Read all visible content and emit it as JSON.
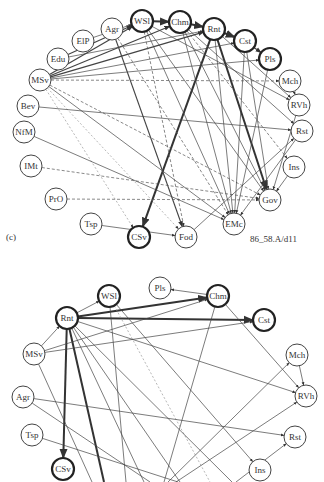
{
  "panel_c": {
    "label": "(c)",
    "caption": "86_58.A/d11",
    "nodes": [
      {
        "id": "WSl",
        "x": 142,
        "y": 21,
        "bold": true
      },
      {
        "id": "Chm",
        "x": 180,
        "y": 22,
        "bold": true
      },
      {
        "id": "Rnt",
        "x": 214,
        "y": 29,
        "bold": true
      },
      {
        "id": "Cst",
        "x": 245,
        "y": 41,
        "bold": true
      },
      {
        "id": "Pls",
        "x": 270,
        "y": 59,
        "bold": true
      },
      {
        "id": "Agr",
        "x": 112,
        "y": 29,
        "bold": false
      },
      {
        "id": "ElP",
        "x": 83,
        "y": 41,
        "bold": false
      },
      {
        "id": "Edu",
        "x": 58,
        "y": 59,
        "bold": false
      },
      {
        "id": "MSv",
        "x": 40,
        "y": 80,
        "bold": false
      },
      {
        "id": "Bev",
        "x": 28,
        "y": 106,
        "bold": false
      },
      {
        "id": "NfM",
        "x": 24,
        "y": 132,
        "bold": false
      },
      {
        "id": "IMt",
        "x": 31,
        "y": 166,
        "bold": false
      },
      {
        "id": "PrO",
        "x": 56,
        "y": 199,
        "bold": false
      },
      {
        "id": "Tsp",
        "x": 91,
        "y": 224,
        "bold": false
      },
      {
        "id": "CSv",
        "x": 139,
        "y": 237,
        "bold": true
      },
      {
        "id": "Fod",
        "x": 186,
        "y": 237,
        "bold": false
      },
      {
        "id": "EMc",
        "x": 234,
        "y": 224,
        "bold": false
      },
      {
        "id": "Gov",
        "x": 270,
        "y": 200,
        "bold": false
      },
      {
        "id": "Ins",
        "x": 294,
        "y": 167,
        "bold": false
      },
      {
        "id": "Rst",
        "x": 302,
        "y": 131,
        "bold": false
      },
      {
        "id": "RVh",
        "x": 299,
        "y": 105,
        "bold": false
      },
      {
        "id": "Mch",
        "x": 290,
        "y": 81,
        "bold": false
      }
    ],
    "edges": [
      {
        "from": "Rnt",
        "to": "CSv",
        "style": "thick"
      },
      {
        "from": "Rnt",
        "to": "Gov",
        "style": "thick"
      },
      {
        "from": "Agr",
        "to": "Fod",
        "style": "medium"
      },
      {
        "from": "WSl",
        "to": "Chm",
        "style": "thick"
      },
      {
        "from": "Chm",
        "to": "Rnt",
        "style": "thick"
      },
      {
        "from": "Rnt",
        "to": "Cst",
        "style": "thick"
      },
      {
        "from": "Cst",
        "to": "Pls",
        "style": "medium"
      },
      {
        "from": "MSv",
        "to": "WSl",
        "style": "medium"
      },
      {
        "from": "MSv",
        "to": "Chm",
        "style": "medium"
      },
      {
        "from": "MSv",
        "to": "Rnt",
        "style": "medium"
      },
      {
        "from": "MSv",
        "to": "Cst",
        "style": "normal"
      },
      {
        "from": "MSv",
        "to": "Pls",
        "style": "normal"
      },
      {
        "from": "MSv",
        "to": "Mch",
        "style": "dashed"
      },
      {
        "from": "MSv",
        "to": "EMc",
        "style": "normal"
      },
      {
        "from": "MSv",
        "to": "Gov",
        "style": "dashed"
      },
      {
        "from": "MSv",
        "to": "Fod",
        "style": "dotted"
      },
      {
        "from": "MSv",
        "to": "CSv",
        "style": "dotted"
      },
      {
        "from": "Edu",
        "to": "WSl",
        "style": "medium"
      },
      {
        "from": "Edu",
        "to": "Rnt",
        "style": "normal"
      },
      {
        "from": "ElP",
        "to": "WSl",
        "style": "normal"
      },
      {
        "from": "Bev",
        "to": "Rst",
        "style": "normal"
      },
      {
        "from": "NfM",
        "to": "EMc",
        "style": "normal"
      },
      {
        "from": "IMt",
        "to": "Gov",
        "style": "dashed"
      },
      {
        "from": "PrO",
        "to": "Gov",
        "style": "dashed"
      },
      {
        "from": "Tsp",
        "to": "Fod",
        "style": "normal"
      },
      {
        "from": "Fod",
        "to": "Rst",
        "style": "normal"
      },
      {
        "from": "WSl",
        "to": "EMc",
        "style": "normal"
      },
      {
        "from": "WSl",
        "to": "Gov",
        "style": "normal"
      },
      {
        "from": "WSl",
        "to": "RVh",
        "style": "normal"
      },
      {
        "from": "Chm",
        "to": "EMc",
        "style": "normal"
      },
      {
        "from": "Chm",
        "to": "Gov",
        "style": "normal"
      },
      {
        "from": "Chm",
        "to": "Rst",
        "style": "normal"
      },
      {
        "from": "Rnt",
        "to": "EMc",
        "style": "normal"
      },
      {
        "from": "Rnt",
        "to": "RVh",
        "style": "normal"
      },
      {
        "from": "Cst",
        "to": "EMc",
        "style": "normal"
      },
      {
        "from": "Cst",
        "to": "Gov",
        "style": "normal"
      },
      {
        "from": "Pls",
        "to": "EMc",
        "style": "normal"
      },
      {
        "from": "Mch",
        "to": "RVh",
        "style": "normal"
      },
      {
        "from": "RVh",
        "to": "Gov",
        "style": "normal"
      },
      {
        "from": "Ins",
        "to": "Gov",
        "style": "normal"
      },
      {
        "from": "Rst",
        "to": "EMc",
        "style": "normal"
      },
      {
        "from": "Agr",
        "to": "EMc",
        "style": "dashed"
      },
      {
        "from": "WSl",
        "to": "Fod",
        "style": "dashed"
      },
      {
        "from": "Chm",
        "to": "Ins",
        "style": "dashed"
      }
    ]
  },
  "panel_d": {
    "nodes": [
      {
        "id": "Rnt",
        "x": 67,
        "y": 318,
        "bold": true
      },
      {
        "id": "WSl",
        "x": 109,
        "y": 296,
        "bold": true
      },
      {
        "id": "Pls",
        "x": 160,
        "y": 288,
        "bold": false
      },
      {
        "id": "Chm",
        "x": 218,
        "y": 296,
        "bold": true
      },
      {
        "id": "Cst",
        "x": 264,
        "y": 320,
        "bold": true
      },
      {
        "id": "MSv",
        "x": 34,
        "y": 354,
        "bold": false
      },
      {
        "id": "Agr",
        "x": 23,
        "y": 397,
        "bold": false
      },
      {
        "id": "Tsp",
        "x": 32,
        "y": 435,
        "bold": false
      },
      {
        "id": "CSv",
        "x": 63,
        "y": 469,
        "bold": true
      },
      {
        "id": "Mch",
        "x": 297,
        "y": 355,
        "bold": false
      },
      {
        "id": "RVh",
        "x": 306,
        "y": 396,
        "bold": false
      },
      {
        "id": "Rst",
        "x": 295,
        "y": 437,
        "bold": false
      },
      {
        "id": "Ins",
        "x": 260,
        "y": 470,
        "bold": false
      }
    ],
    "edges": [
      {
        "from": "Rnt",
        "to": "CSv",
        "style": "thick"
      },
      {
        "from": "Rnt",
        "to": "BOT1",
        "style": "thick"
      },
      {
        "from": "Rnt",
        "to": "Chm",
        "style": "thick"
      },
      {
        "from": "Rnt",
        "to": "Cst",
        "style": "thick"
      },
      {
        "from": "Rnt",
        "to": "WSl",
        "style": "normal"
      },
      {
        "from": "Chm",
        "to": "Pls",
        "style": "normal"
      },
      {
        "from": "Chm",
        "to": "RVh",
        "style": "normal"
      },
      {
        "from": "Chm",
        "to": "BOT3",
        "style": "normal"
      },
      {
        "from": "MSv",
        "to": "Rnt",
        "style": "normal"
      },
      {
        "from": "MSv",
        "to": "Chm",
        "style": "normal"
      },
      {
        "from": "MSv",
        "to": "Cst",
        "style": "normal"
      },
      {
        "from": "MSv",
        "to": "BOT2",
        "style": "normal"
      },
      {
        "from": "WSl",
        "to": "Ins",
        "style": "normal"
      },
      {
        "from": "WSl",
        "to": "BOT4",
        "style": "normal"
      },
      {
        "from": "WSl",
        "to": "BOT5",
        "style": "dotted"
      },
      {
        "from": "Rnt",
        "to": "RVh",
        "style": "normal"
      },
      {
        "from": "Rnt",
        "to": "BOT6",
        "style": "normal"
      },
      {
        "from": "Rnt",
        "to": "BOT7",
        "style": "normal"
      },
      {
        "from": "Rnt",
        "to": "BOT8",
        "style": "normal"
      },
      {
        "from": "Agr",
        "to": "Rst",
        "style": "normal"
      },
      {
        "from": "Agr",
        "to": "BOT9",
        "style": "normal"
      },
      {
        "from": "Tsp",
        "to": "BOT10",
        "style": "normal"
      },
      {
        "from": "Mch",
        "to": "RVh",
        "style": "normal"
      },
      {
        "from": "BOT11",
        "to": "Mch",
        "style": "normal"
      },
      {
        "from": "BOT12",
        "to": "RVh",
        "style": "normal"
      },
      {
        "from": "BOT13",
        "to": "Rst",
        "style": "normal"
      }
    ],
    "offscreen": {
      "BOT1": {
        "x": 104,
        "y": 482
      },
      "BOT2": {
        "x": 92,
        "y": 482
      },
      "BOT3": {
        "x": 164,
        "y": 482
      },
      "BOT4": {
        "x": 126,
        "y": 482
      },
      "BOT5": {
        "x": 210,
        "y": 482
      },
      "BOT6": {
        "x": 144,
        "y": 482
      },
      "BOT7": {
        "x": 180,
        "y": 482
      },
      "BOT8": {
        "x": 232,
        "y": 482
      },
      "BOT9": {
        "x": 150,
        "y": 482
      },
      "BOT10": {
        "x": 178,
        "y": 482
      },
      "BOT11": {
        "x": 168,
        "y": 482
      },
      "BOT12": {
        "x": 176,
        "y": 482
      },
      "BOT13": {
        "x": 236,
        "y": 482
      }
    }
  }
}
